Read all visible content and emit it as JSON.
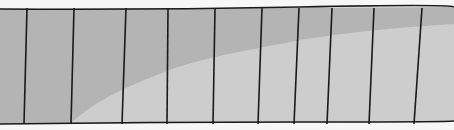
{
  "diagram": {
    "colors": {
      "background": "#f7f7f7",
      "upper_region": "#b4b4b4",
      "lower_region": "#cdcdcd",
      "lines": "#1a1a1a"
    },
    "strip": {
      "x0": 0,
      "x1": 454,
      "top_y_left": 9,
      "top_y_right": 7,
      "bottom_y_left": 124,
      "bottom_y_right": 121
    },
    "dividers": [
      {
        "x_top": 27,
        "x_bottom": 24
      },
      {
        "x_top": 74,
        "x_bottom": 71
      },
      {
        "x_top": 126,
        "x_bottom": 122
      },
      {
        "x_top": 168,
        "x_bottom": 167
      },
      {
        "x_top": 215,
        "x_bottom": 213
      },
      {
        "x_top": 262,
        "x_bottom": 258
      },
      {
        "x_top": 299,
        "x_bottom": 294
      },
      {
        "x_top": 332,
        "x_bottom": 327
      },
      {
        "x_top": 374,
        "x_bottom": 369
      },
      {
        "x_top": 422,
        "x_bottom": 414
      }
    ],
    "curve_path": "M70,124 C95,100 130,85 175,68 C220,54 260,48 300,40 C350,32 400,27 454,24"
  }
}
